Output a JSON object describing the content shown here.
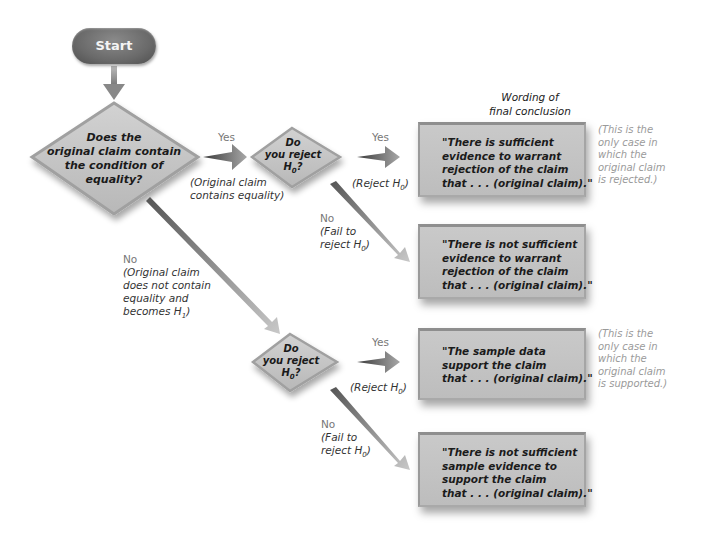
{
  "start": {
    "label": "Start"
  },
  "decision_main": {
    "lines": [
      "Does the",
      "original claim contain",
      "the condition of",
      "equality?"
    ]
  },
  "branch_yes_main": {
    "label": "Yes",
    "note_lines": [
      "(Original claim",
      "contains equality)"
    ]
  },
  "branch_no_main": {
    "label": "No",
    "note_lines": [
      "(Original claim",
      "does not contain",
      "equality and",
      "becomes H"
    ],
    "note_sub": "1",
    "note_close": ")"
  },
  "decision_upper": {
    "lines": [
      "Do",
      "you reject",
      "H"
    ],
    "sub": "0",
    "suffix": "?"
  },
  "decision_lower": {
    "lines": [
      "Do",
      "you reject",
      "H"
    ],
    "sub": "0",
    "suffix": "?"
  },
  "upper_yes": {
    "label": "Yes",
    "note": "(Reject H",
    "note_sub": "0",
    "note_close": ")"
  },
  "upper_no": {
    "label": "No",
    "note_lines": [
      "(Fail to",
      "reject H"
    ],
    "note_sub": "0",
    "note_close": ")"
  },
  "lower_yes": {
    "label": "Yes",
    "note": "(Reject H",
    "note_sub": "0",
    "note_close": ")"
  },
  "lower_no": {
    "label": "No",
    "note_lines": [
      "(Fail to",
      "reject H"
    ],
    "note_sub": "0",
    "note_close": ")"
  },
  "heading": {
    "lines": [
      "Wording of",
      "final conclusion"
    ]
  },
  "conclusions": [
    {
      "lines": [
        "\"There is sufficient",
        "evidence to warrant",
        "rejection of the claim",
        "that . . . (original claim).\""
      ]
    },
    {
      "lines": [
        "\"There is not sufficient",
        "evidence to warrant",
        "rejection of the claim",
        "that . . . (original claim).\""
      ]
    },
    {
      "lines": [
        "\"The sample data",
        "support the claim",
        "that . . . (original claim).\""
      ]
    },
    {
      "lines": [
        "\"There is not sufficient",
        "sample evidence to",
        "support the claim",
        "that . . . (original claim).\""
      ]
    }
  ],
  "side_notes": {
    "rejected": [
      "(This is the",
      "only case in",
      "which the",
      "original claim",
      "is rejected.)"
    ],
    "supported": [
      "(This is the",
      "only case in",
      "which the",
      "original claim",
      "is supported.)"
    ]
  },
  "colors": {
    "start_fill": "#6a6a6a",
    "diamond_fill": "#c4c4c4",
    "box_fill": "#c4c4c4",
    "arrow": "#9a9a9a",
    "note_text": "#9a9a9a"
  }
}
